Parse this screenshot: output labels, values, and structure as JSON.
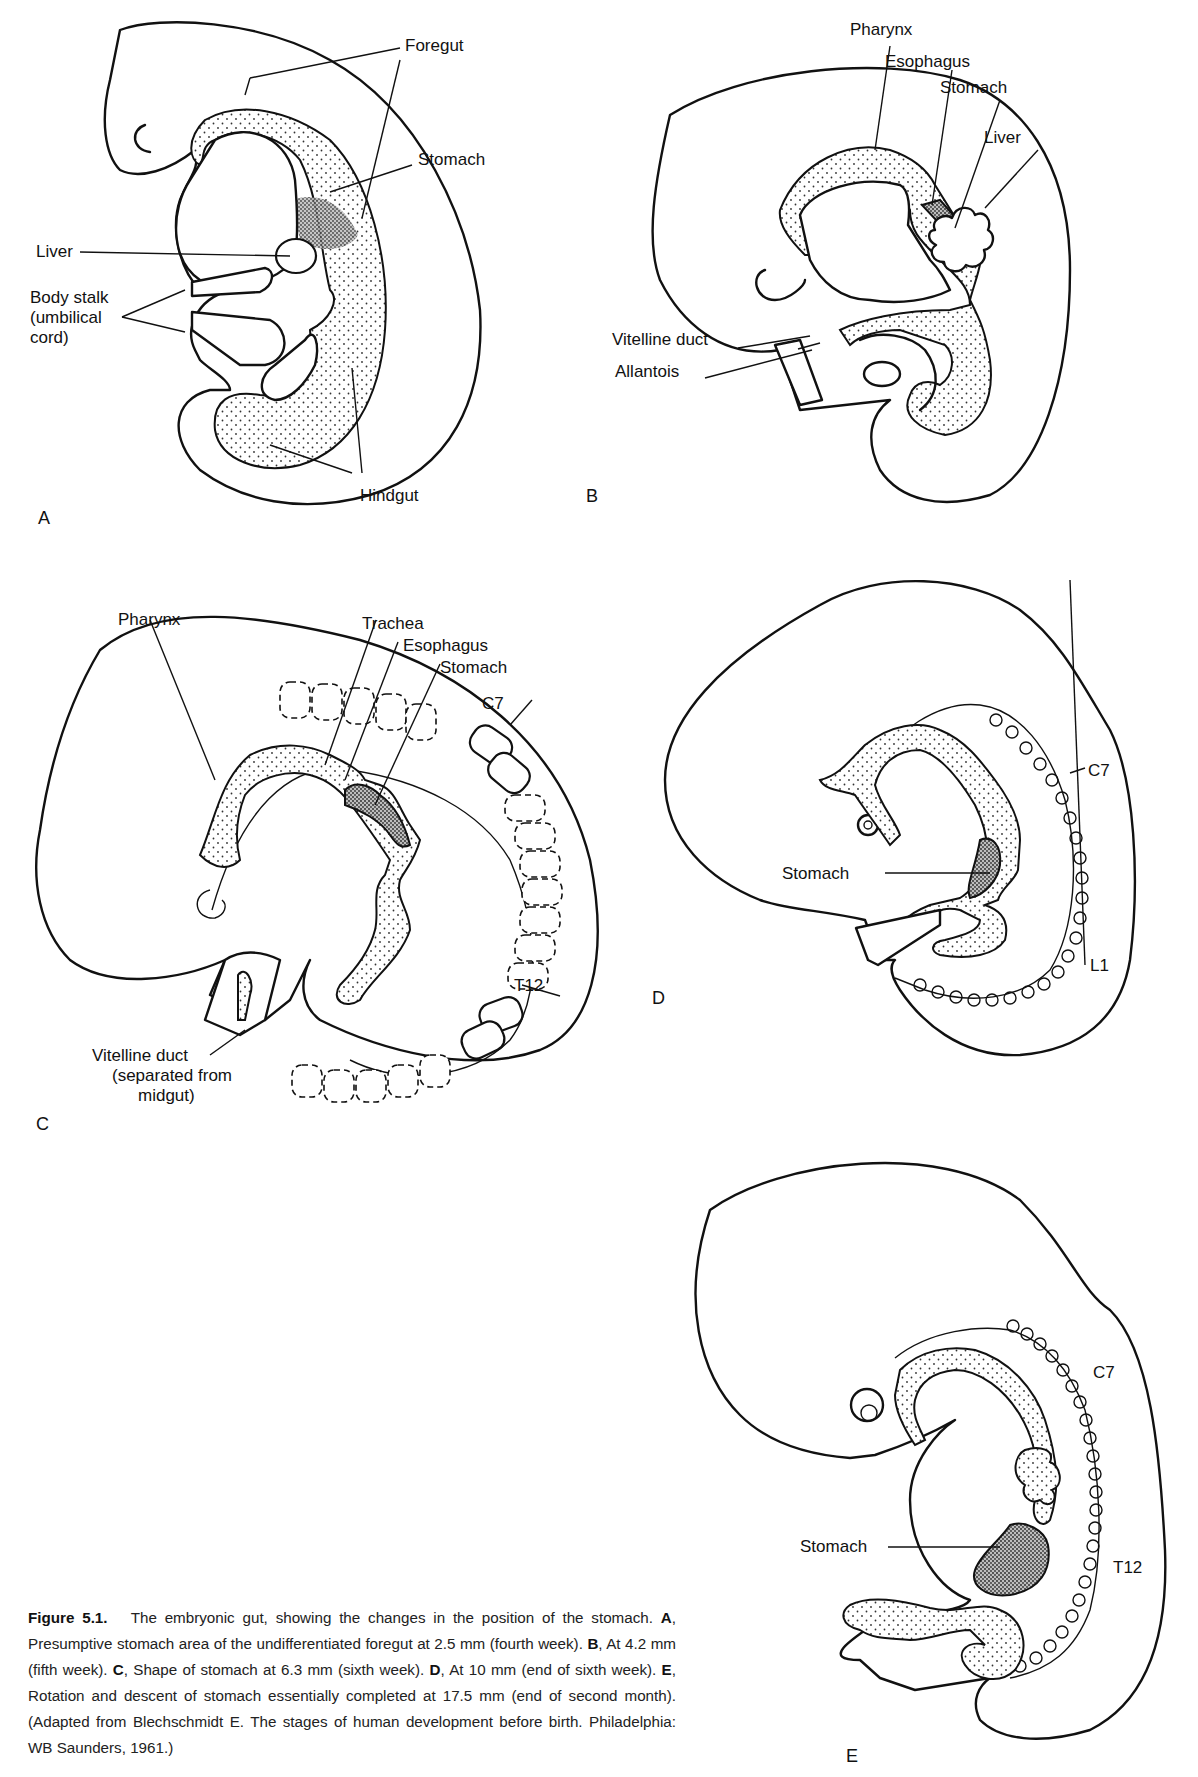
{
  "figure": {
    "number": "Figure 5.1.",
    "caption": {
      "lead": "The embryonic gut, showing the changes in the position of the stomach.",
      "parts": [
        {
          "letter": "A",
          "text": ", Presumptive stomach area of the undifferentiated foregut at 2.5 mm (fourth week)."
        },
        {
          "letter": "B",
          "text": ", At 4.2 mm (fifth week)."
        },
        {
          "letter": "C",
          "text": ", Shape of stomach at 6.3 mm (sixth week)."
        },
        {
          "letter": "D",
          "text": ", At 10 mm (end of sixth week)."
        },
        {
          "letter": "E",
          "text": ", Rotation and descent of stomach essentially completed at 17.5 mm (end of second month). (Adapted from Blechschmidt E. The stages of human development before birth. Philadelphia: WB Saunders, 1961.)"
        }
      ]
    }
  },
  "panels": {
    "A": {
      "letter": "A",
      "labels": {
        "foregut": "Foregut",
        "stomach": "Stomach",
        "liver": "Liver",
        "body_stalk_1": "Body stalk",
        "body_stalk_2": "(umbilical",
        "body_stalk_3": "cord)",
        "hindgut": "Hindgut"
      }
    },
    "B": {
      "letter": "B",
      "labels": {
        "pharynx": "Pharynx",
        "esophagus": "Esophagus",
        "stomach": "Stomach",
        "liver": "Liver",
        "vitelline_duct": "Vitelline duct",
        "allantois": "Allantois"
      }
    },
    "C": {
      "letter": "C",
      "labels": {
        "pharynx": "Pharynx",
        "trachea": "Trachea",
        "esophagus": "Esophagus",
        "stomach": "Stomach",
        "c7": "C7",
        "t12": "T12",
        "vitelline_1": "Vitelline duct",
        "vitelline_2": "(separated from",
        "vitelline_3": "midgut)"
      }
    },
    "D": {
      "letter": "D",
      "labels": {
        "stomach": "Stomach",
        "c7": "C7",
        "l1": "L1"
      }
    },
    "E": {
      "letter": "E",
      "labels": {
        "stomach": "Stomach",
        "c7": "C7",
        "t12": "T12"
      }
    }
  }
}
